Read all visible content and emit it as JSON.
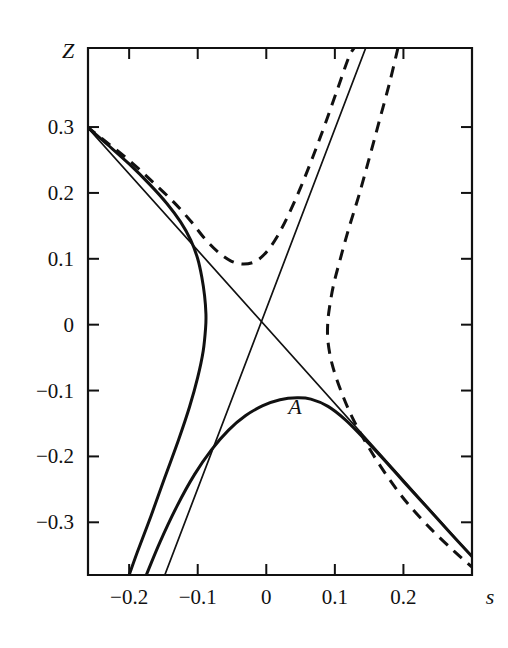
{
  "chart_data": {
    "type": "line",
    "title": "",
    "xlabel": "s",
    "ylabel": "Z",
    "xlim": [
      -0.26,
      0.3
    ],
    "ylim": [
      -0.38,
      0.42
    ],
    "grid": false,
    "legend": null,
    "xticks": [
      -0.2,
      -0.1,
      0,
      0.1,
      0.2
    ],
    "xtick_labels": [
      "−0.2",
      "−0.1",
      "0",
      "0.1",
      "0.2"
    ],
    "yticks": [
      0.3,
      0.2,
      0.1,
      0,
      -0.1,
      -0.2,
      -0.3
    ],
    "ytick_labels": [
      "0.3",
      "0.2",
      "0.1",
      "0",
      "−0.1",
      "−0.2",
      "−0.3"
    ],
    "annotations": [
      {
        "text": "A",
        "x": 0.042,
        "y": -0.135
      }
    ],
    "series": [
      {
        "name": "upper-left solid branch",
        "style": "solid",
        "width": "thick",
        "points": [
          [
            -0.262,
            0.301
          ],
          [
            -0.23,
            0.272
          ],
          [
            -0.2,
            0.244
          ],
          [
            -0.17,
            0.213
          ],
          [
            -0.145,
            0.184
          ],
          [
            -0.125,
            0.156
          ],
          [
            -0.11,
            0.128
          ],
          [
            -0.1,
            0.1
          ],
          [
            -0.094,
            0.072
          ],
          [
            -0.09,
            0.044
          ],
          [
            -0.088,
            0.016
          ],
          [
            -0.0885,
            -0.005
          ],
          [
            -0.092,
            -0.04
          ],
          [
            -0.1,
            -0.08
          ],
          [
            -0.112,
            -0.125
          ],
          [
            -0.128,
            -0.175
          ],
          [
            -0.148,
            -0.232
          ],
          [
            -0.168,
            -0.29
          ],
          [
            -0.188,
            -0.345
          ],
          [
            -0.2,
            -0.38
          ]
        ]
      },
      {
        "name": "lower-right solid branch with label A",
        "style": "solid",
        "width": "thick",
        "points": [
          [
            -0.175,
            -0.38
          ],
          [
            -0.155,
            -0.33
          ],
          [
            -0.13,
            -0.275
          ],
          [
            -0.105,
            -0.228
          ],
          [
            -0.08,
            -0.19
          ],
          [
            -0.055,
            -0.16
          ],
          [
            -0.03,
            -0.138
          ],
          [
            -0.005,
            -0.123
          ],
          [
            0.02,
            -0.114
          ],
          [
            0.045,
            -0.111
          ],
          [
            0.065,
            -0.113
          ],
          [
            0.09,
            -0.124
          ],
          [
            0.115,
            -0.144
          ],
          [
            0.14,
            -0.17
          ],
          [
            0.17,
            -0.203
          ],
          [
            0.2,
            -0.238
          ],
          [
            0.235,
            -0.278
          ],
          [
            0.27,
            -0.318
          ],
          [
            0.3,
            -0.352
          ]
        ]
      },
      {
        "name": "left thin asymptote",
        "style": "solid",
        "width": "thin",
        "points": [
          [
            -0.262,
            0.301
          ],
          [
            0.3,
            -0.352
          ]
        ]
      },
      {
        "name": "right thin asymptote",
        "style": "solid",
        "width": "thin",
        "points": [
          [
            -0.148,
            -0.38
          ],
          [
            0.145,
            0.42
          ]
        ]
      },
      {
        "name": "upper dashed branch",
        "style": "dashed",
        "width": "thick",
        "points": [
          [
            -0.262,
            0.301
          ],
          [
            -0.228,
            0.273
          ],
          [
            -0.195,
            0.245
          ],
          [
            -0.165,
            0.216
          ],
          [
            -0.135,
            0.186
          ],
          [
            -0.11,
            0.157
          ],
          [
            -0.09,
            0.131
          ],
          [
            -0.07,
            0.11
          ],
          [
            -0.052,
            0.097
          ],
          [
            -0.034,
            0.092
          ],
          [
            -0.016,
            0.096
          ],
          [
            0.0,
            0.11
          ],
          [
            0.016,
            0.134
          ],
          [
            0.032,
            0.166
          ],
          [
            0.05,
            0.208
          ],
          [
            0.068,
            0.255
          ],
          [
            0.086,
            0.305
          ],
          [
            0.104,
            0.358
          ],
          [
            0.12,
            0.405
          ],
          [
            0.128,
            0.42
          ]
        ]
      },
      {
        "name": "lower-right dashed branch",
        "style": "dashed",
        "width": "thick",
        "points": [
          [
            0.192,
            0.42
          ],
          [
            0.18,
            0.368
          ],
          [
            0.165,
            0.31
          ],
          [
            0.15,
            0.252
          ],
          [
            0.135,
            0.196
          ],
          [
            0.12,
            0.145
          ],
          [
            0.108,
            0.1
          ],
          [
            0.098,
            0.06
          ],
          [
            0.092,
            0.025
          ],
          [
            0.0895,
            0.0
          ],
          [
            0.09,
            -0.026
          ],
          [
            0.096,
            -0.06
          ],
          [
            0.108,
            -0.098
          ],
          [
            0.125,
            -0.14
          ],
          [
            0.148,
            -0.184
          ],
          [
            0.175,
            -0.228
          ],
          [
            0.205,
            -0.27
          ],
          [
            0.24,
            -0.31
          ],
          [
            0.275,
            -0.345
          ],
          [
            0.3,
            -0.368
          ]
        ]
      }
    ]
  },
  "axes": {
    "y_title": "Z",
    "x_title": "s"
  }
}
